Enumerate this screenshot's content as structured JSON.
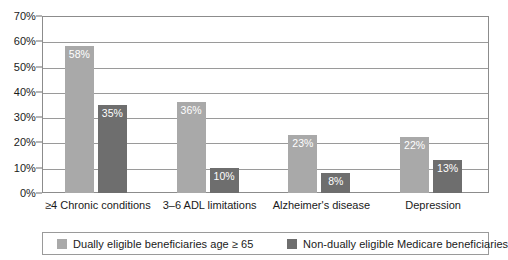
{
  "chart_data": {
    "type": "bar",
    "title": "",
    "xlabel": "",
    "ylabel": "",
    "ylim": [
      0,
      70
    ],
    "ytick_labels": [
      "0%",
      "10%",
      "20%",
      "30%",
      "40%",
      "50%",
      "60%",
      "70%"
    ],
    "ytick_values": [
      0,
      10,
      20,
      30,
      40,
      50,
      60,
      70
    ],
    "grid": true,
    "legend_position": "bottom",
    "categories": [
      "≥4 Chronic conditions",
      "3–6 ADL limitations",
      "Alzheimer's disease",
      "Depression"
    ],
    "series": [
      {
        "name": "Dually eligible beneficiaries age ≥ 65",
        "color": "#a9a9a9",
        "values": [
          58,
          36,
          23,
          22
        ],
        "labels": [
          "58%",
          "36%",
          "23%",
          "22%"
        ]
      },
      {
        "name": "Non-dually eligible Medicare beneficiaries",
        "color": "#6e6e6e",
        "values": [
          35,
          10,
          8,
          13
        ],
        "labels": [
          "35%",
          "10%",
          "8%",
          "13%"
        ]
      }
    ]
  },
  "legend": {
    "entries": [
      {
        "label": "Dually eligible beneficiaries age ≥ 65",
        "color": "#a9a9a9"
      },
      {
        "label": "Non-dually eligible Medicare beneficiaries",
        "color": "#6e6e6e"
      }
    ]
  },
  "colors": {
    "series_light": "#a9a9a9",
    "series_dark": "#6e6e6e",
    "gridline": "#9a9a9a",
    "plot_border": "#8c8c8c",
    "text": "#1a1a1a",
    "value_label": "#ffffff",
    "background": "#ffffff"
  }
}
